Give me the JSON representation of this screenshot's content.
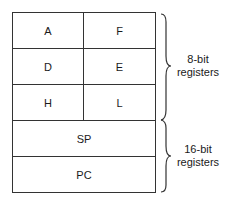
{
  "diagram": {
    "registers_8bit": [
      {
        "left": "A",
        "right": "F"
      },
      {
        "left": "D",
        "right": "E"
      },
      {
        "left": "H",
        "right": "L"
      }
    ],
    "registers_16bit": [
      "SP",
      "PC"
    ],
    "group_labels": {
      "eight_bit_line1": "8-bit",
      "eight_bit_line2": "registers",
      "sixteen_bit_line1": "16-bit",
      "sixteen_bit_line2": "registers"
    }
  }
}
